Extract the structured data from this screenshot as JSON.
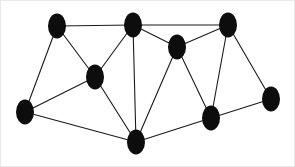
{
  "figure": {
    "kind": "undirected-graph-diagram",
    "background_color": "#ffffff",
    "border_color": "#e8e8e8",
    "width": 295,
    "height": 167
  },
  "style": {
    "node_fill": "#0d0d0d",
    "node_rx": 9,
    "node_ry": 12.5,
    "edge_color": "#1a1a1a",
    "edge_width": 1.1
  },
  "graph": {
    "node_count": 10,
    "edge_count": 19,
    "nodes": [
      {
        "id": "n1",
        "name": "top-left-node",
        "cx": 56,
        "cy": 25,
        "rx": 9,
        "ry": 12.5
      },
      {
        "id": "n2",
        "name": "top-middle-node",
        "cx": 132,
        "cy": 24,
        "rx": 9,
        "ry": 12.5
      },
      {
        "id": "n3",
        "name": "top-right-node",
        "cx": 227,
        "cy": 24,
        "rx": 9,
        "ry": 12.5
      },
      {
        "id": "n4",
        "name": "upper-right-inner-node",
        "cx": 176,
        "cy": 46,
        "rx": 9,
        "ry": 12.5
      },
      {
        "id": "n5",
        "name": "middle-left-node",
        "cx": 94,
        "cy": 76,
        "rx": 9,
        "ry": 12.5
      },
      {
        "id": "n6",
        "name": "far-left-node",
        "cx": 24,
        "cy": 111,
        "rx": 9,
        "ry": 12.5
      },
      {
        "id": "n7",
        "name": "bottom-middle-node",
        "cx": 135,
        "cy": 141,
        "rx": 9,
        "ry": 12.5
      },
      {
        "id": "n8",
        "name": "lower-right-node",
        "cx": 210,
        "cy": 117,
        "rx": 9,
        "ry": 12.5
      },
      {
        "id": "n9",
        "name": "far-right-node",
        "cx": 270,
        "cy": 98,
        "rx": 9,
        "ry": 12.5
      },
      {
        "id": "n10",
        "name": "upper-right-corner-link-node",
        "cx": 227,
        "cy": 24,
        "rx": 0,
        "ry": 0
      }
    ],
    "edges": [
      {
        "from": "n1",
        "to": "n2",
        "x1": 56,
        "y1": 25,
        "x2": 132,
        "y2": 24
      },
      {
        "from": "n1",
        "to": "n5",
        "x1": 56,
        "y1": 25,
        "x2": 94,
        "y2": 76
      },
      {
        "from": "n1",
        "to": "n6",
        "x1": 56,
        "y1": 25,
        "x2": 24,
        "y2": 111
      },
      {
        "from": "n2",
        "to": "n3",
        "x1": 132,
        "y1": 24,
        "x2": 227,
        "y2": 24
      },
      {
        "from": "n2",
        "to": "n4",
        "x1": 132,
        "y1": 24,
        "x2": 176,
        "y2": 46
      },
      {
        "from": "n2",
        "to": "n5",
        "x1": 132,
        "y1": 24,
        "x2": 94,
        "y2": 76
      },
      {
        "from": "n2",
        "to": "n7",
        "x1": 132,
        "y1": 24,
        "x2": 135,
        "y2": 141
      },
      {
        "from": "n3",
        "to": "n4",
        "x1": 227,
        "y1": 24,
        "x2": 176,
        "y2": 46
      },
      {
        "from": "n3",
        "to": "n8",
        "x1": 227,
        "y1": 24,
        "x2": 210,
        "y2": 117
      },
      {
        "from": "n3",
        "to": "n9",
        "x1": 227,
        "y1": 24,
        "x2": 270,
        "y2": 98
      },
      {
        "from": "n4",
        "to": "n7",
        "x1": 176,
        "y1": 46,
        "x2": 135,
        "y2": 141
      },
      {
        "from": "n4",
        "to": "n8",
        "x1": 176,
        "y1": 46,
        "x2": 210,
        "y2": 117
      },
      {
        "from": "n5",
        "to": "n6",
        "x1": 94,
        "y1": 76,
        "x2": 24,
        "y2": 111
      },
      {
        "from": "n5",
        "to": "n7",
        "x1": 94,
        "y1": 76,
        "x2": 135,
        "y2": 141
      },
      {
        "from": "n6",
        "to": "n7",
        "x1": 24,
        "y1": 111,
        "x2": 135,
        "y2": 141
      },
      {
        "from": "n7",
        "to": "n8",
        "x1": 135,
        "y1": 141,
        "x2": 210,
        "y2": 117
      },
      {
        "from": "n8",
        "to": "n9",
        "x1": 210,
        "y1": 117,
        "x2": 270,
        "y2": 98
      }
    ]
  }
}
